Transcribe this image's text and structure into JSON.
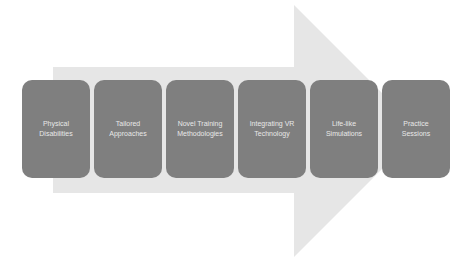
{
  "diagram": {
    "type": "process-arrow",
    "colors": {
      "arrow_fill": "#e6e6e6",
      "box_fill": "#7f7f7f",
      "box_text": "#e8e8e8",
      "background": "#ffffff"
    },
    "steps": [
      {
        "label": "Physical\nDisabilities"
      },
      {
        "label": "Tailored\nApproaches"
      },
      {
        "label": "Novel Training\nMethodologies"
      },
      {
        "label": "Integrating VR\nTechnology"
      },
      {
        "label": "Life-like\nSimulations"
      },
      {
        "label": "Practice\nSessions"
      }
    ]
  }
}
